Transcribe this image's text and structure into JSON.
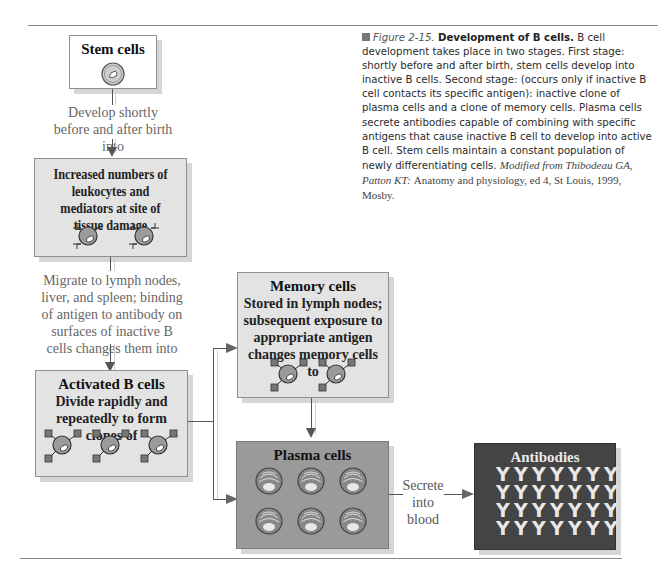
{
  "figure": {
    "number": "Figure 2-15.",
    "heading": "Development of B cells.",
    "caption": "B cell development takes place in two stages. First stage: shortly before and after birth, stem cells develop into inactive B cells. Second stage: (occurs only if inactive B cell contacts its specific antigen): inactive clone of plasma cells and a clone of memory cells. Plasma cells secrete antibodies capable of combining with specific antigens that cause inactive B cell to develop into active B cell. Stem cells maintain a constant population of newly differentiating cells.",
    "citation_italic": "Modified from Thibodeau GA, Patton KT:",
    "citation_roman": "Anatomy and physiology, ed 4, St Louis, 1999, Mosby."
  },
  "nodes": {
    "stem": {
      "title": "Stem cells",
      "cell_count": 1
    },
    "leukocytes": {
      "body": "Increased numbers of leukocytes and mediators at site of tissue damage",
      "cell_count": 2
    },
    "activated": {
      "title": "Activated B cells",
      "body": "Divide rapidly and repeatedly to form clones of",
      "cell_count": 3
    },
    "memory": {
      "title": "Memory cells",
      "body": "Stored in lymph nodes; subsequent exposure to appropriate antigen changes memory cells to",
      "cell_count": 2
    },
    "plasma": {
      "title": "Plasma cells",
      "cell_count": 6
    },
    "antibodies": {
      "title": "Antibodies",
      "rows": 4,
      "cols": 7,
      "glyph": "Y"
    }
  },
  "edges": {
    "stem_to_leukocytes": "Develop shortly before and after birth into",
    "leukocytes_to_activated": "Migrate to lymph nodes, liver, and spleen; binding of antigen to antibody on surfaces of inactive B cells changes them into",
    "plasma_to_antibodies": "Secrete into blood"
  },
  "colors": {
    "light_box": "#e3e3e3",
    "plasma_box": "#9a9a9a",
    "antibody_box": "#444444",
    "cell_fill": "#9b9b9b",
    "receptor": "#666666"
  }
}
